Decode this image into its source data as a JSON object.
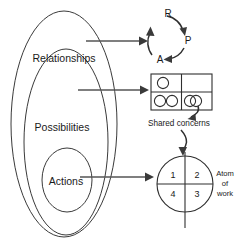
{
  "figure": {
    "nested_ellipses": [
      {
        "label": "Relationships"
      },
      {
        "label": "Possibilities"
      },
      {
        "label": "Actions"
      }
    ],
    "cycle": {
      "nodes": [
        {
          "id": "R",
          "label": "R"
        },
        {
          "id": "P",
          "label": "P"
        },
        {
          "id": "A",
          "label": "A"
        }
      ]
    },
    "grid": {
      "caption": "Shared concerns",
      "cells": [
        {
          "position": "top-left",
          "circles": 1,
          "overlapping": false
        },
        {
          "position": "top-right",
          "circles": 0,
          "overlapping": false
        },
        {
          "position": "bottom-left",
          "circles": 2,
          "overlapping": false
        },
        {
          "position": "bottom-right",
          "circles": 2,
          "overlapping": true
        }
      ]
    },
    "quadrant_circle": {
      "quadrants": [
        {
          "position": "top-left",
          "label": "1"
        },
        {
          "position": "top-right",
          "label": "2"
        },
        {
          "position": "bottom-right",
          "label": "3"
        },
        {
          "position": "bottom-left",
          "label": "4"
        }
      ],
      "side_label_lines": [
        "Atom",
        "of",
        "work"
      ]
    },
    "colors": {
      "ink": "#1a1a1a",
      "line": "#3a3a3a",
      "background": "#ffffff"
    }
  }
}
